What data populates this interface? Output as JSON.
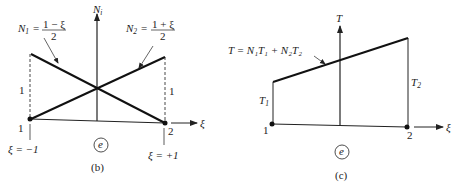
{
  "panel_b": {
    "caption": "(b)",
    "y_axis_label": "N",
    "y_axis_sub": "i",
    "x_axis_label": "ξ",
    "n1_label": {
      "name": "N",
      "sub": "1",
      "eq": "=",
      "num": "1 − ξ",
      "den": "2"
    },
    "n2_label": {
      "name": "N",
      "sub": "2",
      "eq": "=",
      "num": "1 + ξ",
      "den": "2"
    },
    "height_left": "1",
    "height_right": "1",
    "node_left": "1",
    "node_right": "2",
    "xi_left": "ξ = −1",
    "xi_right": "ξ = +1",
    "element": "e"
  },
  "panel_c": {
    "caption": "(c)",
    "y_axis_label": "T",
    "x_axis_label": "ξ",
    "curve_label": "T = N₁T₁ + N₂T₂",
    "t1_label": {
      "name": "T",
      "sub": "1"
    },
    "t2_label": {
      "name": "T",
      "sub": "2"
    },
    "node_left": "1",
    "node_right": "2",
    "element": "e"
  }
}
